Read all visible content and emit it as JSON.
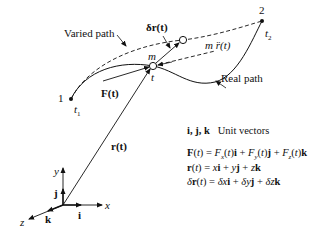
{
  "diagram": {
    "labels": {
      "varied_path": "Varied path",
      "real_path": "Real path",
      "point1": "1",
      "point2": "2",
      "t1": "t",
      "t1_sub": "1",
      "t2": "t",
      "t2_sub": "2",
      "mass": "m",
      "time_t": "t",
      "force": "F(t)",
      "position": "r(t)",
      "variation": "δr(t)",
      "inertia": "m r̈(t)",
      "axis_x": "x",
      "axis_y": "y",
      "axis_z": "z",
      "unit_i": "i",
      "unit_j": "j",
      "unit_k": "k"
    },
    "legend": {
      "unit_vectors_symbols": "i, j, k",
      "unit_vectors_text": "Unit vectors"
    },
    "equations": [
      "F(t) = Fx(t)i + Fy(t)j + Fz(t)k",
      "r(t) = xi + yj + zk",
      "δr(t) = δxi + δyj + δzk"
    ],
    "colors": {
      "ink": "#111111",
      "background": "#ffffff"
    }
  }
}
